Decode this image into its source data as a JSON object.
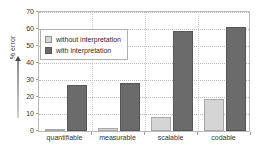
{
  "chart_data": {
    "type": "bar",
    "title": "",
    "xlabel": "",
    "ylabel": "% error",
    "ylim": [
      0,
      70
    ],
    "yticks": [
      0,
      10,
      20,
      30,
      40,
      50,
      60,
      70
    ],
    "grid": true,
    "legend_position": "upper-left-inside",
    "categories": [
      "quantifiable",
      "measurable",
      "scalable",
      "codable"
    ],
    "series": [
      {
        "name": "without interpretation",
        "color": "#d5d5d5",
        "values": [
          1,
          2,
          8,
          19
        ]
      },
      {
        "name": "with interpretation",
        "color": "#6b6b6b",
        "values": [
          27,
          28,
          59,
          61
        ]
      }
    ]
  },
  "axis": {
    "y_label": "% error",
    "y_tick_labels": [
      "70",
      "60",
      "50",
      "40",
      "30",
      "20",
      "10",
      "0"
    ],
    "x_tick_labels": [
      "quantifiable",
      "measurable",
      "scalable",
      "codable"
    ]
  },
  "legend": {
    "items": [
      {
        "label": "without interpretation",
        "swatch": "light-gray-swatch"
      },
      {
        "label": "with interpretation",
        "swatch": "dark-gray-swatch"
      }
    ]
  },
  "colors": {
    "series_light": "#d5d5d5",
    "series_dark": "#6b6b6b",
    "grid": "#bdbdbd",
    "frame": "#b9b9b9",
    "text": "#2b2b2b",
    "background": "#ffffff"
  }
}
